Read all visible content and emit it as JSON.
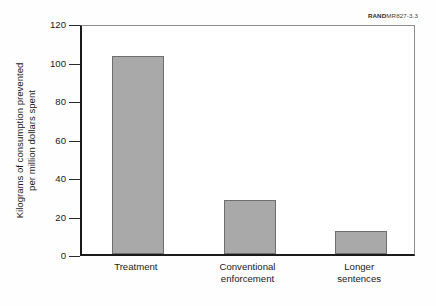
{
  "figure": {
    "source_label_bold": "RAND",
    "source_label_rest": "MR827-3.3"
  },
  "chart_data": {
    "type": "bar",
    "title": "",
    "xlabel": "",
    "ylabel": "Kilograms of consumption prevented per million dollars spent",
    "ylabel_lines": [
      "Kilograms of consumption prevented",
      "per million dollars spent"
    ],
    "categories": [
      "Treatment",
      "Conventional enforcement",
      "Longer sentences"
    ],
    "category_lines": [
      [
        "Treatment"
      ],
      [
        "Conventional",
        "enforcement"
      ],
      [
        "Longer",
        "sentences"
      ]
    ],
    "values": [
      103,
      28,
      12
    ],
    "ylim": [
      0,
      120
    ],
    "yticks": [
      0,
      20,
      40,
      60,
      80,
      100,
      120
    ],
    "ytick_labels": [
      "0",
      "20",
      "40",
      "60",
      "80",
      "100",
      "120"
    ],
    "grid": false,
    "legend": false,
    "bar_color": "#a9a9a9",
    "bar_edge_color": "#6e6e6e",
    "axis_color": "#1a1a1a"
  }
}
